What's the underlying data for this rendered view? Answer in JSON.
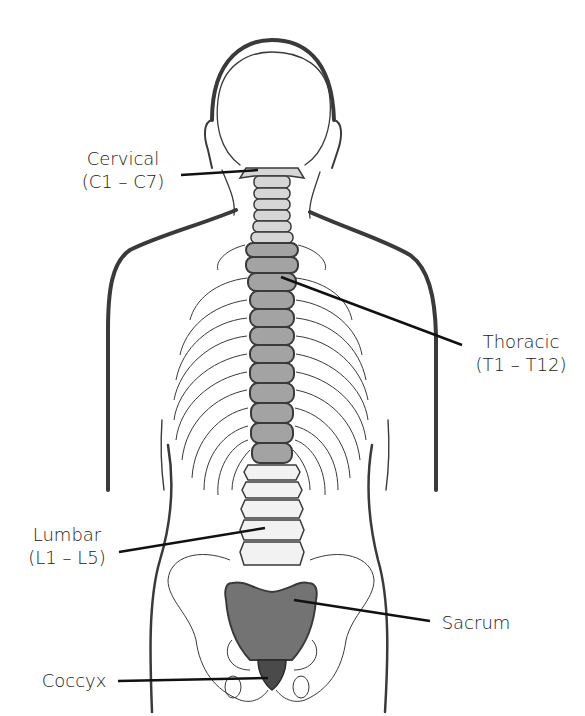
{
  "diagram": {
    "colors": {
      "outline": "#3a3a3a",
      "cervical": "#d6d6d6",
      "thoracic": "#a3a3a3",
      "lumbar": "#f2f2f2",
      "sacrum": "#737373",
      "coccyx": "#4a4a4a"
    },
    "labels": {
      "cervical": {
        "name": "Cervical",
        "range": "(C1 – C7)"
      },
      "thoracic": {
        "name": "Thoracic",
        "range": "(T1 – T12)"
      },
      "lumbar": {
        "name": "Lumbar",
        "range": "(L1 – L5)"
      },
      "sacrum": {
        "name": "Sacrum"
      },
      "coccyx": {
        "name": "Coccyx"
      }
    }
  }
}
